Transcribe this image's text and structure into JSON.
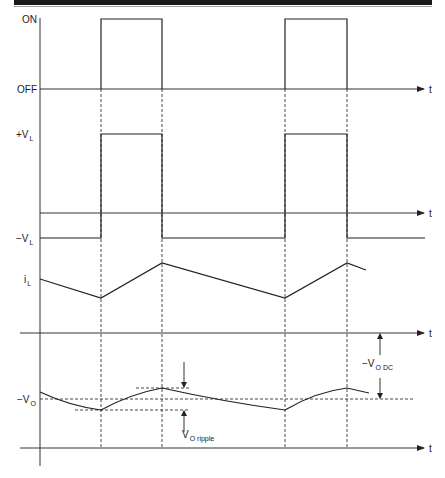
{
  "figure": {
    "type": "timing-diagram",
    "time_axis_label": "t",
    "switch_edges": [
      "t1",
      "t2",
      "t3",
      "t4"
    ]
  },
  "traces": {
    "switch": {
      "label_on": "ON",
      "label_off": "OFF",
      "levels": [
        "OFF",
        "ON",
        "OFF",
        "ON",
        "OFF"
      ]
    },
    "inductor_voltage": {
      "label_pos": "+V",
      "label_pos_sub": "L",
      "label_neg": "−V",
      "label_neg_sub": "L"
    },
    "inductor_current": {
      "label": "i",
      "label_sub": "L"
    },
    "output_voltage": {
      "label": "−V",
      "label_sub": "O",
      "ripple_label": "V",
      "ripple_sub": "O  ripple",
      "dc_label": "−V",
      "dc_sub": "O  DC"
    }
  },
  "colors": {
    "line": "#222222",
    "header_bar": "#1a1a1a",
    "background": "#ffffff"
  }
}
